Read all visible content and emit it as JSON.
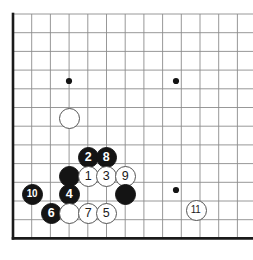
{
  "figure": {
    "kind": "go-board-diagram",
    "board_size": 19,
    "title": "",
    "caption": ""
  },
  "board": {
    "spacing": 18.7,
    "origin_x": 13,
    "origin_y": 14,
    "cols_visible": 13,
    "rows_visible": 13,
    "border_color": "#1a1a1a",
    "line_color": "#8c8c8c",
    "background": "#ffffff",
    "border_width": 2.6,
    "line_width": 0.9,
    "stone_radius": 10.5
  },
  "hoshi": {
    "color": "#141414",
    "radius": 3.1,
    "points": [
      {
        "name": "hoshi-upper-left",
        "x": 69,
        "y": 81
      },
      {
        "name": "hoshi-upper-right",
        "x": 176,
        "y": 81
      },
      {
        "name": "hoshi-lower-right",
        "x": 176,
        "y": 190
      }
    ]
  },
  "stones": [
    {
      "name": "white-stone-unnumbered-upper",
      "color": "white",
      "label": "",
      "x": 69,
      "y": 118
    },
    {
      "name": "black-stone-2",
      "color": "black",
      "label": "2",
      "x": 88,
      "y": 157
    },
    {
      "name": "black-stone-8",
      "color": "black",
      "label": "8",
      "x": 106,
      "y": 157
    },
    {
      "name": "black-stone-unnumbered-left",
      "color": "black",
      "label": "",
      "x": 69,
      "y": 176
    },
    {
      "name": "white-stone-1",
      "color": "white",
      "label": "1",
      "x": 88,
      "y": 176
    },
    {
      "name": "white-stone-3",
      "color": "white",
      "label": "3",
      "x": 106,
      "y": 176
    },
    {
      "name": "white-stone-9",
      "color": "white",
      "label": "9",
      "x": 125,
      "y": 176
    },
    {
      "name": "black-stone-10",
      "color": "black",
      "label": "10",
      "x": 32,
      "y": 194
    },
    {
      "name": "black-stone-4",
      "color": "black",
      "label": "4",
      "x": 69,
      "y": 194
    },
    {
      "name": "black-stone-unnumbered-right",
      "color": "black",
      "label": "",
      "x": 125,
      "y": 194
    },
    {
      "name": "black-stone-6",
      "color": "black",
      "label": "6",
      "x": 51,
      "y": 213
    },
    {
      "name": "white-stone-unnumbered-lower",
      "color": "white",
      "label": "",
      "x": 69,
      "y": 213
    },
    {
      "name": "white-stone-7",
      "color": "white",
      "label": "7",
      "x": 88,
      "y": 213
    },
    {
      "name": "white-stone-5",
      "color": "white",
      "label": "5",
      "x": 106,
      "y": 213
    },
    {
      "name": "white-stone-11",
      "color": "white",
      "label": "11",
      "x": 196,
      "y": 210
    }
  ]
}
